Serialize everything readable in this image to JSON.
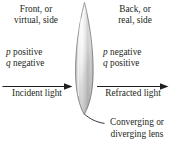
{
  "figure": {
    "background_color": "#ffffff",
    "text_color": "#231f20",
    "line_color": "#231f20"
  },
  "front_side": {
    "heading_line1": "Front, or",
    "heading_line2": "virtual, side",
    "object_symbol": "p",
    "object_sign": "positive",
    "image_symbol": "q",
    "image_sign": "negative",
    "light_label": "Incident light"
  },
  "back_side": {
    "heading_line1": "Back, or",
    "heading_line2": "real, side",
    "object_symbol": "p",
    "object_sign": "negative",
    "image_symbol": "q",
    "image_sign": "positive",
    "light_label": "Refracted light"
  },
  "lens": {
    "caption_line1": "Converging or",
    "caption_line2": "diverging lens",
    "shape": "biconvex-lens",
    "fill_light": "#ffffff",
    "fill_mid": "#d8d8d8",
    "fill_dark": "#9a9a9a",
    "outline_color": "#7a7a7a"
  },
  "arrows": {
    "incident_arrow_name": "incident-light-arrow",
    "refracted_arrow_name": "refracted-light-arrow",
    "leader_line_name": "lens-leader-line"
  }
}
